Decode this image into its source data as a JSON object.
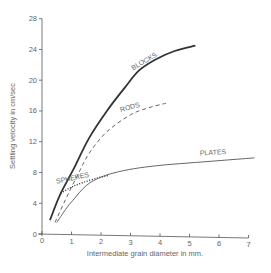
{
  "chart_data": {
    "type": "line",
    "title": "",
    "xlabel": "Intermediate grain diameter in mm.",
    "ylabel": "Settling velocity in cm/sec",
    "xlim": [
      0,
      7
    ],
    "ylim": [
      0,
      28
    ],
    "xticks": [
      0,
      1,
      2,
      3,
      4,
      5,
      6,
      7
    ],
    "yticks": [
      0,
      4,
      8,
      12,
      16,
      20,
      24,
      28
    ],
    "grid": false,
    "legend": "inline labels on curves",
    "series": [
      {
        "name": "BLOCKS",
        "style": "solid-thick",
        "x": [
          0.27,
          0.6,
          1.05,
          1.6,
          2.2,
          2.8,
          3.3,
          3.9,
          4.5,
          5.2
        ],
        "y": [
          1.8,
          5.0,
          8.3,
          12.5,
          16.0,
          19.0,
          21.3,
          22.8,
          23.8,
          24.5
        ],
        "label_at": [
          3.5,
          22.2
        ]
      },
      {
        "name": "RODS",
        "style": "dashed",
        "x": [
          0.44,
          0.8,
          1.2,
          1.6,
          2.2,
          3.0,
          3.6,
          4.2
        ],
        "y": [
          1.5,
          4.5,
          7.6,
          10.5,
          13.3,
          15.5,
          16.4,
          17.0
        ],
        "label_at": [
          3.0,
          16.2
        ]
      },
      {
        "name": "SPHERES",
        "style": "dotted",
        "x": [
          0.64,
          1.0,
          1.4,
          1.9,
          2.25
        ],
        "y": [
          5.3,
          6.1,
          6.7,
          7.3,
          7.6
        ],
        "label_at": [
          1.05,
          7.0
        ]
      },
      {
        "name": "PLATES",
        "style": "solid-thin",
        "x": [
          0.5,
          0.8,
          1.05,
          1.5,
          2.0,
          2.6,
          3.3,
          4.2,
          5.2,
          6.2,
          7.2
        ],
        "y": [
          1.5,
          3.2,
          4.4,
          6.3,
          7.4,
          8.1,
          8.6,
          9.0,
          9.3,
          9.6,
          9.9
        ],
        "label_at": [
          5.8,
          10.3
        ]
      }
    ]
  }
}
